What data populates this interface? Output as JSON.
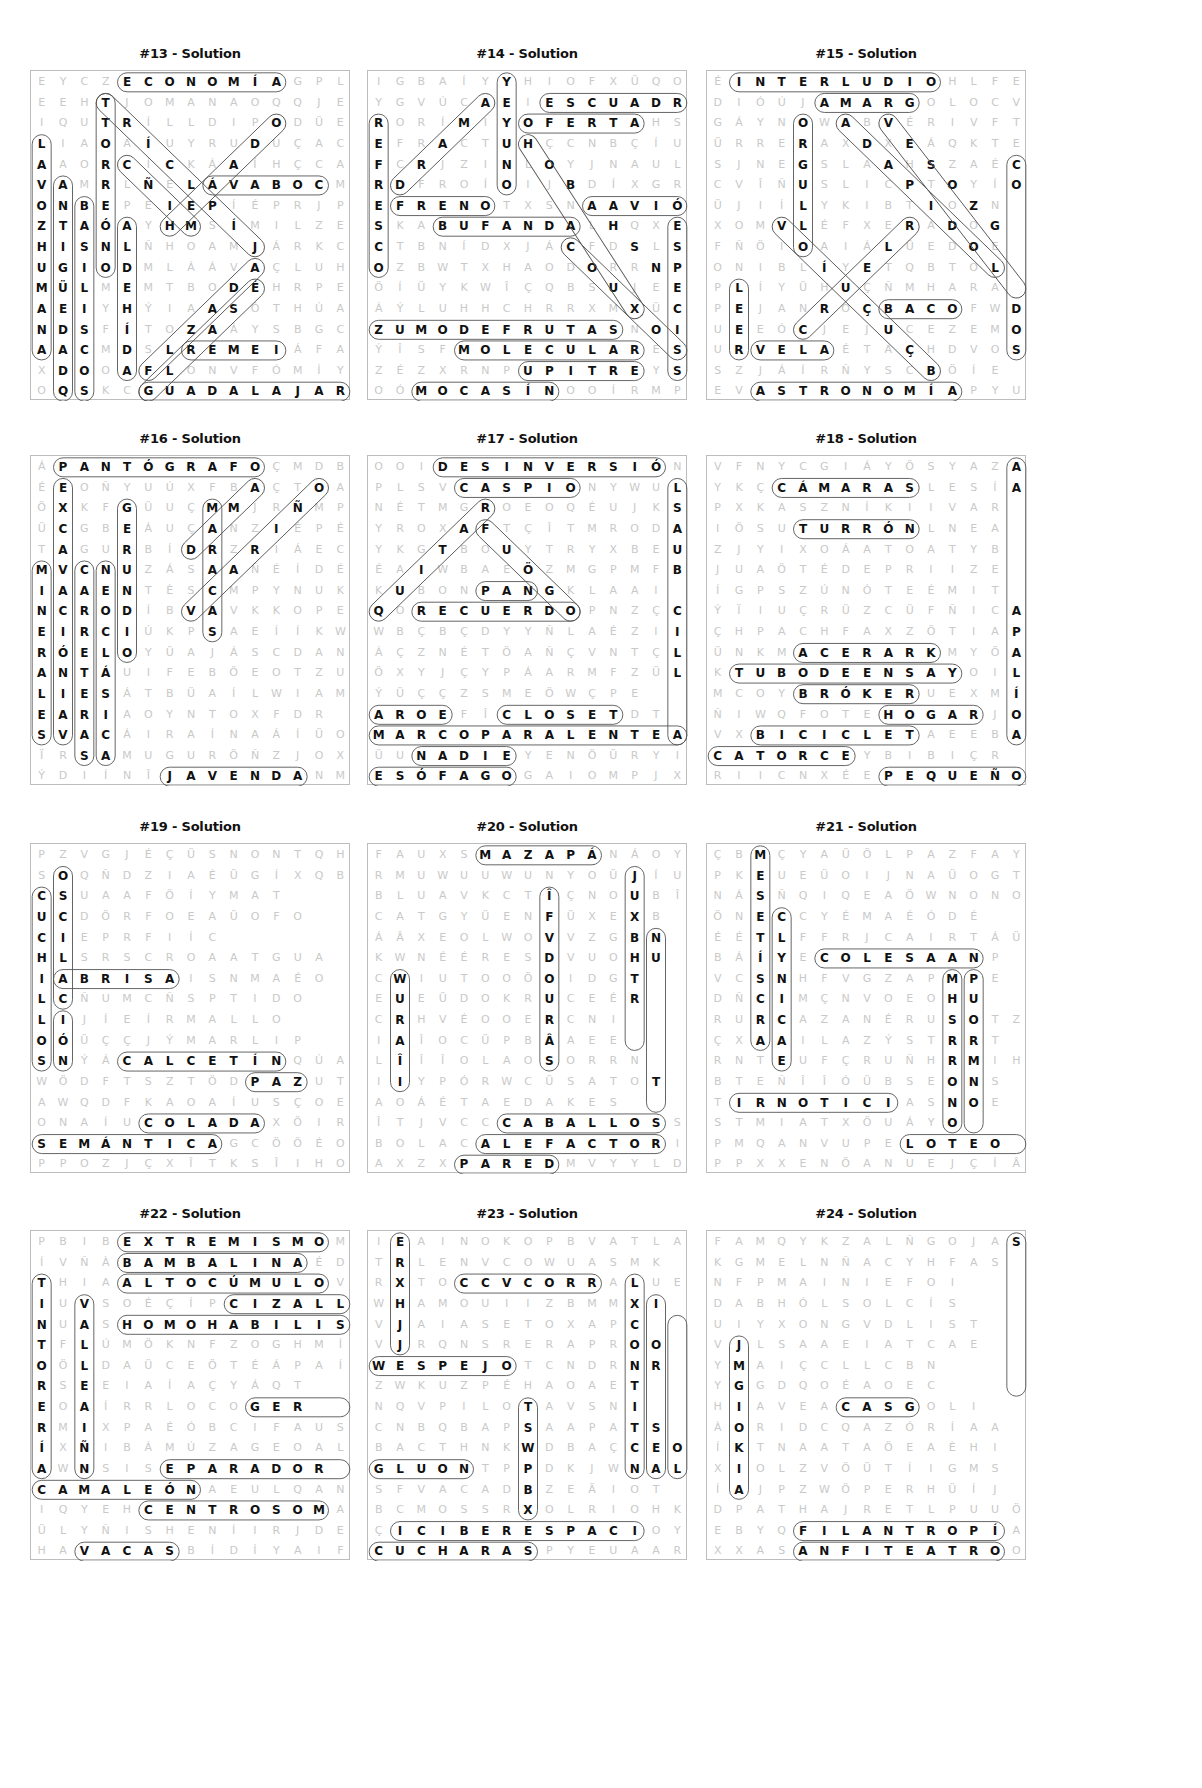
{
  "colors": {
    "ink": "#111111",
    "faint": "#c9c9c9",
    "border": "#bdbdbd",
    "capsule": "#555555"
  },
  "puzzles": [
    {
      "title": "#13 - Solution",
      "x": 30,
      "y": 70,
      "rows": [
        "EYCZECONOMÍAGPL",
        "EEHTJOMANAOQQJE",
        "IQUTRÍLLDIPODÜE",
        "LIAOAÍUYRUDUÇAC",
        "AAORCÍCKÁAÍHÇCA",
        "VAMRLÑELÁVABOCM",
        "ONBEPEIEPÍÉPRJP",
        "ZTAÓAYHMSÍMILZE",
        "HISNLÑHOAMJÁRKC",
        "UGIODMLÁÁVAÇLUH",
        "MÜLMEMTBODÉHRPE",
        "AEIYHÝIAASÓTHÚA",
        "NDSFÍTOZAÁYSBGC",
        "AACMDSLREMEIÁFA",
        "XDOOAFLONVFÓMÍY",
        "OQSKCGUADALAJARA"
      ],
      "words": [
        [
          0,
          4,
          0,
          11
        ],
        [
          1,
          3,
          9,
          3
        ],
        [
          3,
          0,
          13,
          0
        ],
        [
          5,
          1,
          15,
          1
        ],
        [
          6,
          2,
          15,
          2
        ],
        [
          7,
          4,
          14,
          4
        ],
        [
          5,
          8,
          5,
          13
        ],
        [
          13,
          7,
          13,
          11
        ],
        [
          15,
          5,
          15,
          14
        ],
        [
          1,
          3,
          8,
          10
        ],
        [
          4,
          4,
          7,
          7
        ],
        [
          2,
          11,
          7,
          6
        ],
        [
          9,
          10,
          14,
          5
        ],
        [
          10,
          10,
          15,
          5
        ]
      ]
    },
    {
      "title": "#14 - Solution",
      "x": 367,
      "y": 70,
      "rows": [
        "IGBAÍYYHIOFXÜQO",
        "YGVÚCAEIESCUADRA",
        "RORÍMIYOFERTAHSW",
        "EFRACTUHÇCNBÇÍUG",
        "FCRJZINLOYJNAULZ",
        "RDFROÍOIJBDÍXGR",
        "EFRENOTXSNAAVIÓN",
        "SKABUFANDALHQXE",
        "CTBNÍDXJÁCFDSLS",
        "OZBWTXHAODORRNP",
        "ÖÍÜYKWÎÇQBSUJEE",
        "ÁÝLUHHCHRRXMXÜC",
        "ZUMODEFRUTASNOI",
        "ÝÎSFMOLECULARESA",
        "ZÉZXRNPUPITREYS",
        "OÓMOCASÍNOOÍRMPG"
      ],
      "words": [
        [
          0,
          6,
          5,
          6
        ],
        [
          1,
          8,
          1,
          14
        ],
        [
          2,
          7,
          2,
          12
        ],
        [
          2,
          0,
          9,
          0
        ],
        [
          5,
          1,
          1,
          5
        ],
        [
          6,
          1,
          6,
          5
        ],
        [
          6,
          10,
          6,
          14
        ],
        [
          7,
          3,
          7,
          9
        ],
        [
          12,
          0,
          12,
          11
        ],
        [
          13,
          4,
          13,
          12
        ],
        [
          14,
          7,
          14,
          12
        ],
        [
          15,
          2,
          15,
          8
        ],
        [
          7,
          14,
          14,
          14
        ],
        [
          3,
          7,
          11,
          12
        ],
        [
          8,
          9,
          13,
          14
        ]
      ]
    },
    {
      "title": "#15 - Solution",
      "x": 706,
      "y": 70,
      "rows": [
        "ÉINTERLUDIOHLFE",
        "DIÓÚJAMARGOLOCVZ",
        "GÁYNOWABVÉRIVFT",
        "ÜRRERAXDXEÁQKTE",
        "SJNEGSLAAHSZAÉC",
        "CVÎÑUSLICPTOYÍO",
        "ÜJIÍLYKIBTIOZN",
        "XOMVLÉFXERADOG",
        "FÑÖIOAIÁLÜEDOE",
        "ONIBLÍYETQBTOL",
        "PLÍYÜHUÇÑMHARA",
        "PEJANROÇBACOFWD",
        "UEEÓCJEJUCEZEMO",
        "URVELAÉTAÇHDVOS",
        "SZJÁÍRÑYSCBÖÍE",
        "EVASTRONOMÍAPYUO"
      ],
      "words": [
        [
          0,
          1,
          0,
          10
        ],
        [
          1,
          5,
          1,
          9
        ],
        [
          2,
          4,
          8,
          4
        ],
        [
          10,
          1,
          13,
          1
        ],
        [
          13,
          2,
          13,
          5
        ],
        [
          15,
          2,
          15,
          11
        ],
        [
          11,
          8,
          11,
          11
        ],
        [
          4,
          14,
          13,
          14
        ],
        [
          7,
          3,
          14,
          10
        ],
        [
          2,
          6,
          9,
          13
        ],
        [
          2,
          8,
          10,
          14
        ],
        [
          12,
          4,
          7,
          9
        ]
      ]
    },
    {
      "title": "#16 - Solution",
      "x": 30,
      "y": 455,
      "rows": [
        "ÁPANTÓGRAFOÇMDBL",
        "ÉEOÑYUÚXFBAÇTOAY",
        "ÖXKFGÜUÇMMJRÑMPE",
        "ÜCGBEÁUÇANZIÉPÉV",
        "TAGURBÍDRZRIÁEC",
        "MVCNUZÁSAAÑÉÍDÉ",
        "IAAENTÈSCMPYNUKD",
        "NCRODÍBVAVKKOPEÍ",
        "EIRCIÚKPSAEÍÍKWÍ",
        "RÓELOYÜAJÁSCDAN",
        "ANTÁUIFEBÖEOTZUQ",
        "LIESÁTBÜAÍLWIAM",
        "EARIAOYNTOXFDR",
        "SVACÁIRAÍNAÁÍÜO",
        "ÏRSAMUGURÖÑZJOXE",
        "ÝDIÍNÎJAVENDANMI"
      ],
      "words": [
        [
          0,
          1,
          0,
          10
        ],
        [
          1,
          1,
          13,
          1
        ],
        [
          2,
          4,
          9,
          4
        ],
        [
          5,
          0,
          13,
          0
        ],
        [
          5,
          2,
          14,
          2
        ],
        [
          5,
          3,
          14,
          3
        ],
        [
          2,
          8,
          8,
          8
        ],
        [
          1,
          10,
          4,
          7
        ],
        [
          1,
          13,
          7,
          7
        ],
        [
          15,
          6,
          15,
          12
        ]
      ]
    },
    {
      "title": "#17 - Solution",
      "x": 367,
      "y": 455,
      "rows": [
        "OOIDESINVERSIÓNW",
        "PLSVCASPIONYWULU",
        "NÉTMGROEOQÉUJKS",
        "YROXAFTÇÎTMRODA",
        "YKGTBOUYTRYXBEUR",
        "ÉAIWBAEÖZMGPMFB",
        "KUBONPANGKLAAI",
        "QORECUERDOPNZÇC",
        "WBÇBÇDYYÑLAÉZII",
        "ÁÇZNÉTÖAÑÇVNTÇL",
        "ÖXYJÇYPÁARMFZÜL",
        "ÝÜÇÇZSMEÖWÇPE",
        "AROEFÎCLOSETDT",
        "MARCOPARALENTEA",
        "ÜUNADIEYENÖÜRYI",
        "ESÓFAGOGAIOMPJX"
      ],
      "words": [
        [
          0,
          3,
          0,
          13
        ],
        [
          1,
          4,
          1,
          9
        ],
        [
          1,
          14,
          13,
          14
        ],
        [
          6,
          5,
          6,
          7
        ],
        [
          7,
          2,
          7,
          9
        ],
        [
          12,
          0,
          12,
          3
        ],
        [
          12,
          6,
          12,
          11
        ],
        [
          13,
          0,
          13,
          14
        ],
        [
          14,
          2,
          14,
          6
        ],
        [
          15,
          0,
          15,
          6
        ],
        [
          2,
          5,
          7,
          0
        ],
        [
          3,
          5,
          7,
          9
        ]
      ]
    },
    {
      "title": "#18 - Solution",
      "x": 706,
      "y": 455,
      "rows": [
        "VFNYCGIÁYÖSYAZAJ",
        "YKÇCÁMARASLESÍA",
        "PXKASZNÍKIIVAR",
        "IÖSUTURRÓNLNEA",
        "ZJYIXOÁATOATYB",
        "JUAÖTÉDEPRIIZE",
        "ÍGPSZÚNÓTEÉMIT",
        "ÝÏIUÇRÜZCÜFÑICA",
        "ÇHPACHFAXZÖTIAP",
        "ÜNKMACERARKMYÖA",
        "KTUBODEENSAYOIL",
        "MCOYBRÓKERUEXMÍ",
        "ÑIWQFOTEHOGARJO",
        "VXBICICLETAEEBA",
        "CATORCEYBIBIÇR",
        "RIICNXÉEPEQUEÑO"
      ],
      "words": [
        [
          1,
          3,
          1,
          9
        ],
        [
          0,
          14,
          13,
          14
        ],
        [
          3,
          4,
          3,
          9
        ],
        [
          9,
          4,
          9,
          10
        ],
        [
          10,
          1,
          10,
          11
        ],
        [
          11,
          4,
          11,
          9
        ],
        [
          12,
          8,
          12,
          12
        ],
        [
          13,
          2,
          13,
          9
        ],
        [
          14,
          0,
          14,
          6
        ],
        [
          15,
          8,
          15,
          14
        ]
      ]
    },
    {
      "title": "#19 - Solution",
      "x": 30,
      "y": 843,
      "rows": [
        "PZVGJÉÇÜSNONTQHC",
        "SOQÑDZIAÉÜGÍXQB",
        "CSUAAFÖÍYMAT",
        "UCDÖRFOEAÜOFO",
        "CIEPRFIÍC",
        "HLSRSCROAATGUA",
        "IABRISAISNMAÉO",
        "LCÑUMCÑSPTIDO",
        "LIJÍEÍRMALLO",
        "OÓÜÇÇJÝMARLIP",
        "SNÝÁCALCETÍNQÚA",
        "WÖDFTSZTÖDPAZUT",
        "AWQDFKAOAÍUSÇOE",
        "ONAÍUCOLADAXÖIR",
        "SEMÁNTICAGCÖÖÉO",
        "PPOZJÇXÎTKSÎIHO"
      ],
      "words": [
        [
          6,
          1,
          6,
          6
        ],
        [
          10,
          4,
          10,
          11
        ],
        [
          11,
          10,
          11,
          12
        ],
        [
          13,
          5,
          13,
          10
        ],
        [
          14,
          0,
          14,
          8
        ],
        [
          1,
          1,
          7,
          1
        ],
        [
          2,
          0,
          10,
          0
        ],
        [
          8,
          1,
          10,
          1
        ]
      ]
    },
    {
      "title": "#20 - Solution",
      "x": 367,
      "y": 843,
      "rows": [
        "FAUXSMAZAPÁNÁOYI",
        "RMUWUUWUNYOÜJÍU",
        "BLUAVKCTÎÇNOUBÎ",
        "CATGYÜENFÜXEXB",
        "ÁÂXEOLWOVVZGBN",
        "KWNÉÉRESDVUOHU",
        "CWIUTOOÖOIDGT",
        "EUEÜDOKRUCEÉR",
        "CRHVÉOOERCNI",
        "IAÎOCÜPBÂAEE",
        "LÎÎÎOLAOSORRN",
        "IIYPÓRWCÜSATOT",
        "AOÁÉTAEDAKES",
        "ÎTJVCCCABALLOSS",
        "BOLACALEFACTORI",
        "AXZXPAREDMVYYLD"
      ],
      "words": [
        [
          0,
          5,
          0,
          10
        ],
        [
          1,
          12,
          9,
          12
        ],
        [
          2,
          8,
          10,
          8
        ],
        [
          4,
          13,
          12,
          13
        ],
        [
          6,
          1,
          11,
          1
        ],
        [
          13,
          6,
          13,
          13
        ],
        [
          14,
          5,
          14,
          13
        ],
        [
          15,
          4,
          15,
          8
        ]
      ]
    },
    {
      "title": "#21 - Solution",
      "x": 706,
      "y": 843,
      "rows": [
        "ÇBMÇYAÜÖLPAZFAYE",
        "PKEUEÜOIJNAÜOGT",
        "NÁSÑQIQEAÖWNONO",
        "ÖNECCYÉMAÉÓDÉ",
        "ÉÉTLFFRJCAIRTÁÜ",
        "BÁÍYECOLESAANP",
        "VCSNHFVGZAPMPE",
        "DÑCIMÇNVOEOHU",
        "RURCAZANÉRUSOTZ",
        "ÇXAAILAZÝSTRRT",
        "RNTEUFÇRUÑHRMIH",
        "BTEÑÎÎÓÜBSEONS",
        "TIRNOTICIASNOE",
        "STMIATXÖUÁYO",
        "PMQANVUPELOTEO",
        "PPXXENÖANUEJÇÍÂO"
      ],
      "words": [
        [
          0,
          2,
          9,
          2
        ],
        [
          12,
          1,
          12,
          8
        ],
        [
          14,
          9,
          14,
          14
        ],
        [
          5,
          5,
          5,
          12
        ],
        [
          3,
          3,
          10,
          3
        ],
        [
          6,
          11,
          13,
          11
        ],
        [
          6,
          12,
          13,
          12
        ]
      ]
    },
    {
      "title": "#22 - Solution",
      "x": 30,
      "y": 1230,
      "rows": [
        "PBIBEXTREMISMOMX",
        "ÍVÑÀBAMBALINAÉDV",
        "THIAALTOCÚMULOVE",
        "IUVSOÉÇÍPCIZALLA",
        "NUASHOMOHABILISX",
        "TFLÚMÖKNFZOGHMÍE",
        "OÖLDAÜCEÖTÉÁPAÍH",
        "RSEEIAÍAÇYÁQT",
        "EOAÍRRLOCOGER",
        "RMIXPAÉÓBCIFAUS",
        "ÍXÑIBÁMÚZAGEOAL",
        "AWNSISEPARADOR",
        "CAMALEÓNAEULQANA",
        "IQYEHCENTROSOMA",
        "ÜLYÑISHENÍIRJDEÍ",
        "HAVACASBÍDÍYAIFH"
      ],
      "words": [
        [
          0,
          4,
          0,
          13
        ],
        [
          1,
          4,
          1,
          12
        ],
        [
          2,
          4,
          2,
          13
        ],
        [
          3,
          9,
          3,
          14
        ],
        [
          4,
          4,
          4,
          14
        ],
        [
          2,
          0,
          11,
          0
        ],
        [
          3,
          2,
          11,
          2
        ],
        [
          12,
          0,
          12,
          7
        ],
        [
          13,
          5,
          13,
          13
        ],
        [
          15,
          2,
          15,
          6
        ],
        [
          11,
          6,
          11,
          14
        ],
        [
          8,
          10,
          8,
          14
        ]
      ]
    },
    {
      "title": "#23 - Solution",
      "x": 367,
      "y": 1230,
      "rows": [
        "IEAINOKOPBVATLA",
        "TRLENVCOWUASMK",
        "RXTOCCVCORRALUE",
        "WHAMOUIIZBMMXI",
        "VJAIASETOXAPC",
        "VJRQNSRERAPROO",
        "WESPEJOTCNDRNR",
        "ZWKUZPÉHAOAET",
        "NQVPILOTAVSNI",
        "CNBQBAPSAAPATS",
        "BACTHNKWDBAÇCEO",
        "GLUONTPPDKJWNAL",
        "SFVACADBZEÄIOT",
        "BCMOSSRXOLRIOHKU",
        "ÇICIBERESPACIOYAM",
        "CUCHARASPYEUAAR"
      ],
      "words": [
        [
          0,
          1,
          5,
          1
        ],
        [
          2,
          4,
          2,
          10
        ],
        [
          6,
          0,
          6,
          6
        ],
        [
          11,
          0,
          11,
          4
        ],
        [
          14,
          1,
          14,
          12
        ],
        [
          15,
          0,
          15,
          7
        ],
        [
          2,
          12,
          11,
          12
        ],
        [
          3,
          13,
          11,
          13
        ],
        [
          4,
          14,
          11,
          14
        ],
        [
          8,
          7,
          13,
          7
        ]
      ]
    },
    {
      "title": "#24 - Solution",
      "x": 706,
      "y": 1230,
      "rows": [
        "FAMQYKZALÑGOJAS",
        "KGMELNÑACYHFAS",
        "NFPMAINIEFOI",
        "DABHÓLSOLCÍS",
        "UIYXONGVDLIST",
        "VJLSAAEIATCAE",
        "YMAIÇCLLCBN",
        "YGGDQOÉAOEC",
        "HIAVEACASGOLI",
        "ÀORIDCQAZÓRÍAA",
        "ÍKTNAATAÖEAÈHI",
        "XIOLZVÖÜTÍIGMS",
        "ÍAJPZWÖPERHÜÍJ",
        "DPATHAJRETLPUUÖF",
        "EBYQFILANTROPÍA",
        "XXASANFITEATROOM"
      ],
      "words": [
        [
          0,
          14,
          7,
          14
        ],
        [
          14,
          4,
          14,
          13
        ],
        [
          15,
          4,
          15,
          13
        ],
        [
          5,
          1,
          12,
          1
        ],
        [
          8,
          6,
          8,
          9
        ]
      ]
    }
  ]
}
